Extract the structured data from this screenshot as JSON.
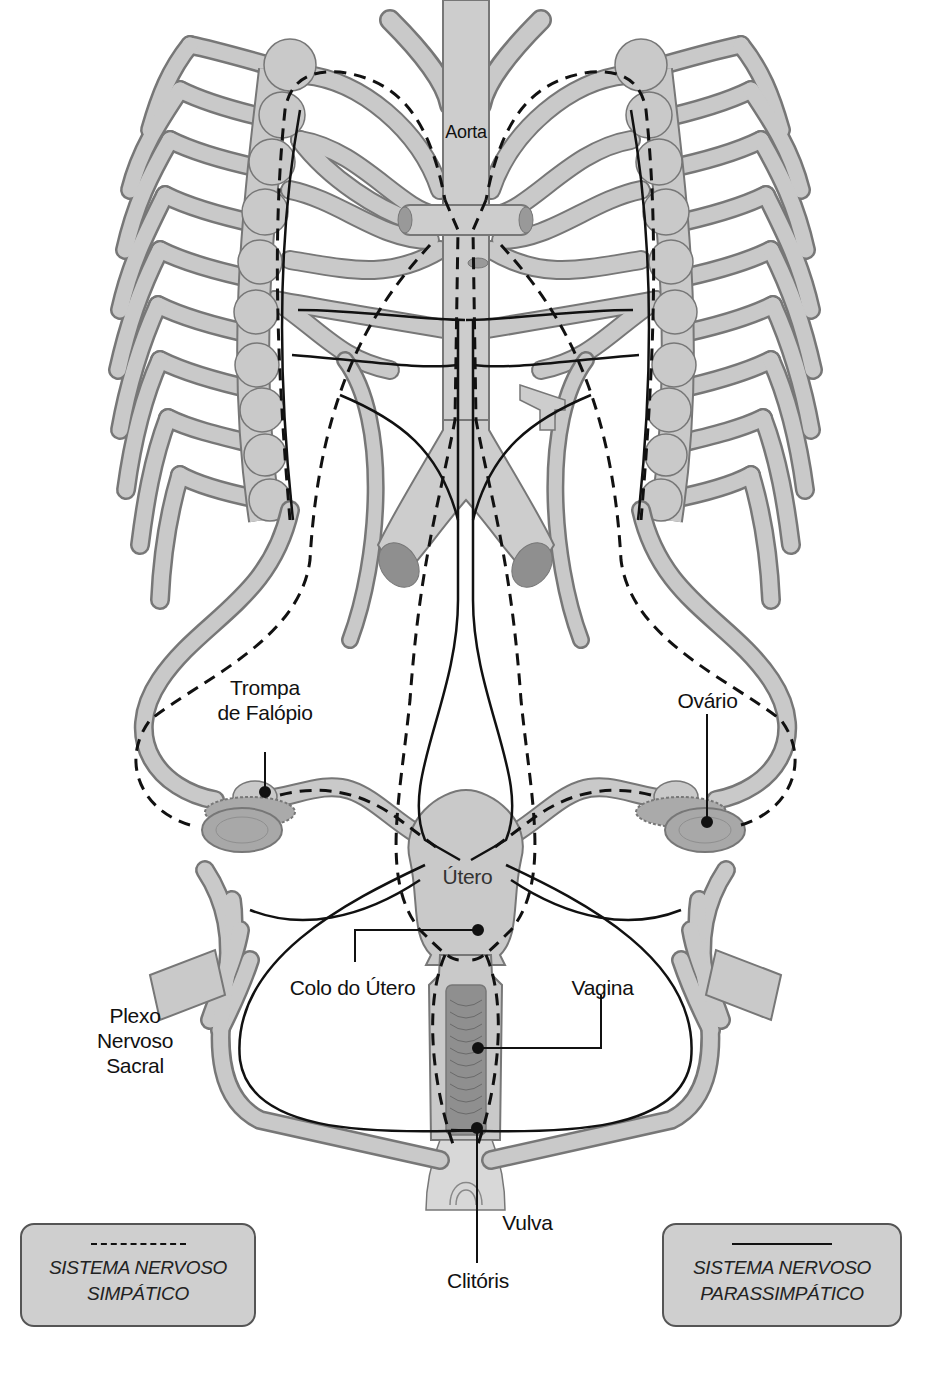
{
  "diagram": {
    "labels": {
      "aorta": "Aorta",
      "trompa_line1": "Trompa",
      "trompa_line2": "de Falópio",
      "ovario": "Ovário",
      "utero": "Útero",
      "colo": "Colo do Útero",
      "vagina": "Vagina",
      "plexo_line1": "Plexo",
      "plexo_line2": "Nervoso",
      "plexo_line3": "Sacral",
      "vulva": "Vulva",
      "clitoris": "Clitóris"
    },
    "legend": [
      {
        "line_style": "dashed",
        "line1": "SISTEMA NERVOSO",
        "line2": "SIMPÁTICO"
      },
      {
        "line_style": "solid",
        "line1": "SISTEMA NERVOSO",
        "line2": "PARASSIMPÁTICO"
      }
    ],
    "colors": {
      "tissue_fill": "#c9c9c9",
      "tissue_dark": "#8f8f8f",
      "outline": "#777777",
      "nerve_line": "#111111",
      "legend_bg": "#cfcfcf"
    }
  }
}
